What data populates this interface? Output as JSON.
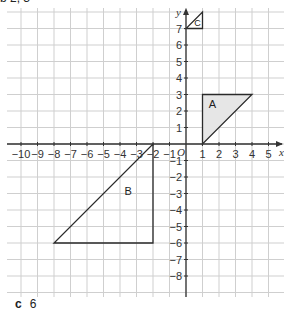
{
  "header": {
    "cut_off_text": "b  2, 3"
  },
  "chart_data": {
    "type": "scatter",
    "title": "",
    "xlabel": "x",
    "ylabel": "y",
    "origin_label": "O",
    "xlim": [
      -11,
      6
    ],
    "ylim": [
      -9,
      8
    ],
    "grid": true,
    "x_ticks": [
      -10,
      -9,
      -8,
      -7,
      -6,
      -5,
      -4,
      -3,
      -2,
      -1,
      1,
      2,
      3,
      4,
      5
    ],
    "y_ticks": [
      7,
      6,
      5,
      4,
      3,
      2,
      1,
      -1,
      -2,
      -3,
      -4,
      -5,
      -6,
      -7,
      -8
    ],
    "shapes": [
      {
        "label": "A",
        "vertices": [
          [
            1,
            0
          ],
          [
            1,
            3
          ],
          [
            4,
            3
          ]
        ],
        "fill": "#e6e6e6"
      },
      {
        "label": "B",
        "vertices": [
          [
            -2,
            0
          ],
          [
            -2,
            -6
          ],
          [
            -8,
            -6
          ]
        ],
        "fill": "none"
      },
      {
        "label": "C",
        "vertices": [
          [
            0,
            7
          ],
          [
            1,
            7
          ],
          [
            1,
            8
          ]
        ],
        "fill": "none"
      }
    ]
  },
  "answer": {
    "part": "c",
    "value": "6"
  },
  "colors": {
    "grid": "#cfcfcf",
    "axis": "#333333",
    "shape_stroke": "#2a2a2a",
    "shape_fill": "#e6e6e6"
  }
}
